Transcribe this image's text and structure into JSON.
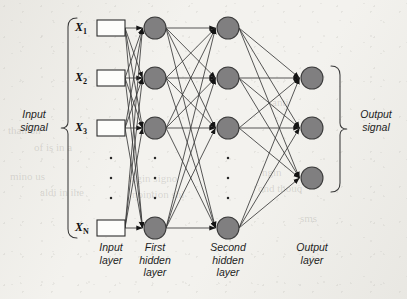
{
  "figure": {
    "kind": "neural-network-architecture-diagram",
    "background_color": "#f4f3ef",
    "ink_color": "#3a3a3a",
    "node_fill_color": "#807f80",
    "node_stroke_color": "#3c3c3c",
    "box_fill_color": "#fdfdfb",
    "arrowhead_color": "#141414"
  },
  "side_labels": {
    "input": "Input\nsignal",
    "output": "Output\nsignal"
  },
  "layer_labels": [
    {
      "id": "input-layer",
      "text": "Input\nlayer"
    },
    {
      "id": "hidden1-layer",
      "text": "First\nhidden\nlayer"
    },
    {
      "id": "hidden2-layer",
      "text": "Second\nhidden\nlayer"
    },
    {
      "id": "output-layer",
      "text": "Output\nlayer"
    }
  ],
  "input_variables": [
    {
      "name": "X",
      "subscript": "1"
    },
    {
      "name": "X",
      "subscript": "2"
    },
    {
      "name": "X",
      "subscript": "3"
    },
    {
      "name": "X",
      "subscript": "N"
    }
  ],
  "ghost_text": [
    {
      "text": "than on",
      "x": 8,
      "y": 124,
      "size": 11
    },
    {
      "text": "of is in a",
      "x": 34,
      "y": 141,
      "size": 11
    },
    {
      "text": "mino us",
      "x": 10,
      "y": 170,
      "size": 11
    },
    {
      "text": "aldi in ihe",
      "x": 40,
      "y": 186,
      "size": 11
    },
    {
      "text": "ingin signo",
      "x": 128,
      "y": 172,
      "size": 11
    },
    {
      "text": "nointion shi",
      "x": 132,
      "y": 188,
      "size": 11
    },
    {
      "text": "ngin",
      "x": 262,
      "y": 166,
      "size": 11
    },
    {
      "text": "ond thouq",
      "x": 258,
      "y": 182,
      "size": 11
    },
    {
      "text": "sms",
      "x": 300,
      "y": 212,
      "size": 11
    },
    {
      "text": "anti",
      "x": 272,
      "y": 96,
      "size": 11
    }
  ],
  "chart_data": {
    "type": "diagram",
    "layers": [
      {
        "id": "input",
        "label": "Input layer",
        "node_shape": "rectangle",
        "x": 111,
        "node_count_shown": 4,
        "node_count_label": "N",
        "nodes_y": [
          28,
          78,
          128,
          228
        ],
        "has_ellipsis": true,
        "ellipsis_y": [
          158,
          178,
          198
        ]
      },
      {
        "id": "hidden1",
        "label": "First hidden layer",
        "node_shape": "circle",
        "x": 155,
        "node_count_shown": 4,
        "nodes_y": [
          28,
          78,
          128,
          228
        ],
        "has_ellipsis": true,
        "ellipsis_y": [
          158,
          178,
          198
        ]
      },
      {
        "id": "hidden2",
        "label": "Second hidden layer",
        "node_shape": "circle",
        "x": 228,
        "node_count_shown": 4,
        "nodes_y": [
          28,
          78,
          128,
          228
        ],
        "has_ellipsis": true,
        "ellipsis_y": [
          158,
          178,
          198
        ]
      },
      {
        "id": "output",
        "label": "Output layer",
        "node_shape": "circle",
        "x": 312,
        "node_count_shown": 3,
        "nodes_y": [
          78,
          128,
          178
        ],
        "has_ellipsis": false,
        "ellipsis_y": []
      }
    ],
    "connections": "fully-connected between consecutive layers, directed left to right",
    "node_radius": 11,
    "box_width": 28,
    "box_height": 16
  }
}
